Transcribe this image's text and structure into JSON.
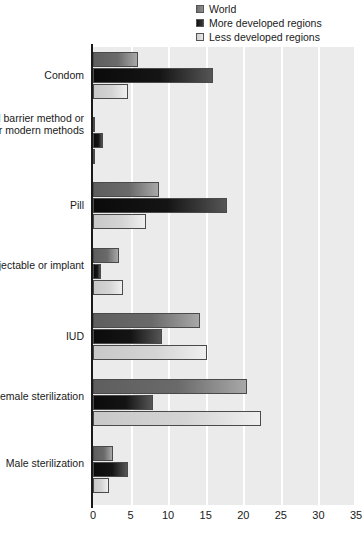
{
  "legend": {
    "position": "top-right",
    "items": [
      {
        "label": "World",
        "swatch": "legend-swatch-world",
        "color": "#6e6e6e"
      },
      {
        "label": "More developed regions",
        "swatch": "legend-swatch-more-developed",
        "color": "#101010"
      },
      {
        "label": "Less developed regions",
        "swatch": "legend-swatch-less-developed",
        "color": "#cfcfcf"
      }
    ]
  },
  "axis": {
    "xticks": [
      "0",
      "5",
      "10",
      "15",
      "20",
      "25",
      "30",
      "35"
    ]
  },
  "chart_data": {
    "type": "bar",
    "orientation": "horizontal",
    "title": "",
    "xlabel": "",
    "ylabel": "",
    "xlim": [
      0,
      35
    ],
    "xticks": [
      0,
      5,
      10,
      15,
      20,
      25,
      30,
      35
    ],
    "grid": "vertical-white-gridlines",
    "legend_position": "top-right",
    "categories": [
      "Condom",
      "Vaginal barrier method or other modern methods",
      "Pill",
      "Injectable or implant",
      "IUD",
      "Female sterilization",
      "Male sterilization"
    ],
    "series": [
      {
        "name": "World",
        "color": "#6e6e6e",
        "values": [
          6.0,
          0.3,
          8.8,
          3.5,
          14.3,
          20.5,
          2.6
        ]
      },
      {
        "name": "More developed regions",
        "color": "#101010",
        "values": [
          16.0,
          1.3,
          17.8,
          1.0,
          9.2,
          8.0,
          4.6
        ]
      },
      {
        "name": "Less developed regions",
        "color": "#cfcfcf",
        "values": [
          4.7,
          0.2,
          7.0,
          4.0,
          15.2,
          22.4,
          2.1
        ]
      }
    ]
  }
}
